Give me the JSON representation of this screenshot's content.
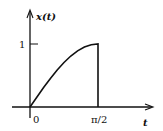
{
  "chart_data": {
    "type": "line",
    "title": "",
    "xlabel": "t",
    "ylabel": "x(t)",
    "x_ticks": [
      "0",
      "π/2"
    ],
    "y_ticks": [
      "1"
    ],
    "series": [
      {
        "name": "x(t)",
        "description": "sin(t) rising from 0 to 1 on [0, π/2], then dropping vertically to 0",
        "x": [
          0,
          0.157,
          0.314,
          0.471,
          0.628,
          0.785,
          0.942,
          1.1,
          1.257,
          1.414,
          1.571,
          1.571
        ],
        "values": [
          0,
          0.156,
          0.309,
          0.454,
          0.588,
          0.707,
          0.809,
          0.891,
          0.951,
          0.988,
          1.0,
          0
        ]
      }
    ],
    "xlim": [
      0,
      1.571
    ],
    "ylim": [
      0,
      1
    ],
    "grid": false,
    "legend": null,
    "colors": {
      "line": "#111111",
      "axis": "#111111"
    }
  },
  "labels": {
    "y_axis": "x(t)",
    "x_axis": "t",
    "origin": "0",
    "x_tick": "π/2",
    "y_tick": "1"
  }
}
